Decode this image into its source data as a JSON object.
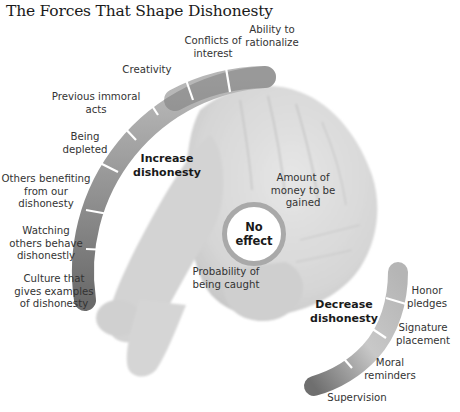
{
  "title": "The Forces That Shape Dishonesty",
  "center": {
    "label": "No\neffect",
    "ring_color": "#a9a9a9"
  },
  "increase": {
    "heading_line1": "Increase",
    "heading_line2": "dishonesty",
    "factors": [
      {
        "line1": "Ability to",
        "line2": "rationalize",
        "line3": ""
      },
      {
        "line1": "Conflicts of",
        "line2": "interest",
        "line3": ""
      },
      {
        "line1": "Creativity",
        "line2": "",
        "line3": ""
      },
      {
        "line1": "Previous immoral",
        "line2": "acts",
        "line3": ""
      },
      {
        "line1": "Being",
        "line2": "depleted",
        "line3": ""
      },
      {
        "line1": "Others benefiting",
        "line2": "from our",
        "line3": "dishonesty"
      },
      {
        "line1": "Watching",
        "line2": "others behave",
        "line3": "dishonestly"
      },
      {
        "line1": "Culture that",
        "line2": "gives examples",
        "line3": "of dishonesty"
      }
    ],
    "gradient": {
      "light": "#c8c8c8",
      "dark": "#6e6e6e"
    }
  },
  "no_effect_factors": [
    {
      "line1": "Amount of",
      "line2": "money to be",
      "line3": "gained"
    },
    {
      "line1": "Probability of",
      "line2": "being caught",
      "line3": ""
    }
  ],
  "decrease": {
    "heading_line1": "Decrease",
    "heading_line2": "dishonesty",
    "factors": [
      {
        "line1": "Honor",
        "line2": "pledges"
      },
      {
        "line1": "Signature",
        "line2": "placement"
      },
      {
        "line1": "Moral",
        "line2": "reminders"
      },
      {
        "line1": "Supervision",
        "line2": ""
      }
    ],
    "gradient": {
      "light": "#cfcfcf",
      "dark": "#757575"
    }
  },
  "image": {
    "description": "crossed-fingers hand (grayscale photo)",
    "color": "#dadada"
  }
}
